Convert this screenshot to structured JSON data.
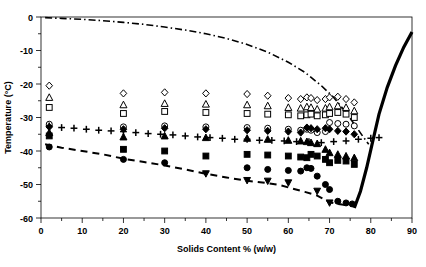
{
  "chart_data": {
    "type": "scatter",
    "title": "",
    "subtitle": "",
    "xlabel": "Solids Content % (w/w)",
    "ylabel": "Temperature (°C)",
    "xlim": [
      0,
      90
    ],
    "ylim": [
      -60,
      0
    ],
    "xticks": [
      0,
      10,
      20,
      30,
      40,
      50,
      60,
      70,
      80,
      90
    ],
    "xtick_labels": [
      "0",
      "10",
      "20",
      "30",
      "40",
      "50",
      "60",
      "70",
      "80",
      "90"
    ],
    "yticks": [
      0,
      -10,
      -20,
      -30,
      -40,
      -50,
      -60
    ],
    "ytick_labels": [
      "0",
      "-10",
      "-20",
      "-30",
      "-40",
      "-50",
      "-60"
    ],
    "x_minor_tick_step": 5,
    "y_minor_tick_step": 5,
    "grid": false,
    "legend": null,
    "legend_position": "none",
    "frame": true,
    "series": [
      {
        "name": "open-diamond",
        "marker": "diamond-open",
        "points": [
          [
            2,
            -20.5
          ],
          [
            20,
            -22.8
          ],
          [
            30,
            -22.5
          ],
          [
            40,
            -22.8
          ],
          [
            50,
            -23.0
          ],
          [
            55,
            -23.5
          ],
          [
            60,
            -24.2
          ],
          [
            63,
            -24.5
          ],
          [
            64.5,
            -24.0
          ],
          [
            65.5,
            -24.2
          ],
          [
            67,
            -24.8
          ],
          [
            69,
            -24.5
          ],
          [
            70,
            -24.0
          ],
          [
            72,
            -23.8
          ],
          [
            74,
            -24.5
          ],
          [
            76,
            -25.5
          ]
        ]
      },
      {
        "name": "open-triangle",
        "marker": "triangle-open",
        "points": [
          [
            2,
            -24.0
          ],
          [
            20,
            -26.2
          ],
          [
            30,
            -25.8
          ],
          [
            40,
            -26.0
          ],
          [
            50,
            -26.2
          ],
          [
            55,
            -26.5
          ],
          [
            60,
            -27.0
          ],
          [
            63,
            -27.2
          ],
          [
            64.5,
            -26.8
          ],
          [
            65.5,
            -27.0
          ],
          [
            67,
            -27.5
          ],
          [
            69,
            -27.2
          ],
          [
            70,
            -26.8
          ],
          [
            72,
            -26.5
          ],
          [
            74,
            -27.0
          ],
          [
            76,
            -28.0
          ]
        ]
      },
      {
        "name": "open-square",
        "marker": "square-open",
        "points": [
          [
            2,
            -27.0
          ],
          [
            20,
            -28.8
          ],
          [
            30,
            -28.2
          ],
          [
            40,
            -28.5
          ],
          [
            50,
            -28.8
          ],
          [
            55,
            -29.0
          ],
          [
            60,
            -29.2
          ],
          [
            63,
            -29.5
          ],
          [
            64.5,
            -29.2
          ],
          [
            65.5,
            -29.0
          ],
          [
            67,
            -29.5
          ],
          [
            69,
            -29.2
          ],
          [
            70,
            -28.8
          ],
          [
            72,
            -28.5
          ],
          [
            74,
            -29.0
          ],
          [
            76,
            -30.0
          ]
        ]
      },
      {
        "name": "open-circle",
        "marker": "circle-open",
        "points": [
          [
            2,
            -32.0
          ],
          [
            20,
            -32.8
          ],
          [
            30,
            -32.5
          ],
          [
            40,
            -32.8
          ],
          [
            50,
            -33.0
          ],
          [
            55,
            -33.2
          ],
          [
            60,
            -33.5
          ],
          [
            63,
            -33.8
          ],
          [
            64.5,
            -33.5
          ],
          [
            65.5,
            -33.8
          ],
          [
            67,
            -34.5
          ],
          [
            69,
            -34.2
          ],
          [
            70,
            -31.5
          ],
          [
            72,
            -31.8
          ],
          [
            74,
            -32.0
          ],
          [
            76,
            -32.5
          ]
        ]
      },
      {
        "name": "plus",
        "marker": "plus",
        "points": [
          [
            2,
            -32.5
          ],
          [
            5,
            -33.0
          ],
          [
            8,
            -33.2
          ],
          [
            11,
            -33.5
          ],
          [
            14,
            -33.8
          ],
          [
            17,
            -34.0
          ],
          [
            20,
            -34.2
          ],
          [
            23,
            -34.5
          ],
          [
            26,
            -34.8
          ],
          [
            29,
            -35.0
          ],
          [
            32,
            -35.2
          ],
          [
            35,
            -35.5
          ],
          [
            38,
            -35.8
          ],
          [
            41,
            -36.0
          ],
          [
            44,
            -36.2
          ],
          [
            47,
            -36.5
          ],
          [
            50,
            -36.5
          ],
          [
            53,
            -36.8
          ],
          [
            56,
            -36.8
          ],
          [
            59,
            -37.0
          ],
          [
            62,
            -37.2
          ],
          [
            65,
            -37.2
          ],
          [
            68,
            -37.5
          ],
          [
            71,
            -37.2
          ],
          [
            74,
            -37.0
          ],
          [
            77,
            -36.5
          ],
          [
            80,
            -36.2
          ],
          [
            82,
            -36.0
          ]
        ]
      },
      {
        "name": "filled-diamond",
        "marker": "diamond-filled",
        "points": [
          [
            2,
            -32.8
          ],
          [
            20,
            -33.5
          ],
          [
            30,
            -33.2
          ],
          [
            40,
            -33.5
          ],
          [
            50,
            -33.8
          ],
          [
            55,
            -34.0
          ],
          [
            60,
            -34.2
          ],
          [
            63,
            -34.5
          ],
          [
            64.5,
            -33.0
          ],
          [
            65.5,
            -33.2
          ],
          [
            67,
            -33.5
          ],
          [
            69,
            -33.2
          ],
          [
            70,
            -33.5
          ],
          [
            72,
            -34.0
          ],
          [
            74,
            -34.2
          ],
          [
            76,
            -35.0
          ]
        ]
      },
      {
        "name": "filled-triangle",
        "marker": "triangle-filled",
        "points": [
          [
            2,
            -34.5
          ],
          [
            20,
            -35.8
          ],
          [
            30,
            -35.5
          ],
          [
            40,
            -36.0
          ],
          [
            50,
            -36.2
          ],
          [
            55,
            -36.5
          ],
          [
            60,
            -36.8
          ],
          [
            63,
            -37.0
          ],
          [
            64.5,
            -37.2
          ],
          [
            65.5,
            -37.5
          ],
          [
            67,
            -37.8
          ],
          [
            69,
            -39.5
          ],
          [
            70,
            -40.5
          ],
          [
            72,
            -41.0
          ],
          [
            74,
            -41.5
          ],
          [
            76,
            -42.0
          ]
        ]
      },
      {
        "name": "filled-square",
        "marker": "square-filled",
        "points": [
          [
            2,
            -35.5
          ],
          [
            20,
            -39.5
          ],
          [
            30,
            -40.0
          ],
          [
            40,
            -41.5
          ],
          [
            50,
            -41.0
          ],
          [
            55,
            -41.2
          ],
          [
            60,
            -41.5
          ],
          [
            63,
            -41.8
          ],
          [
            64.5,
            -42.0
          ],
          [
            65.5,
            -41.0
          ],
          [
            67,
            -41.5
          ],
          [
            69,
            -42.5
          ],
          [
            70,
            -43.5
          ],
          [
            72,
            -42.8
          ],
          [
            74,
            -43.0
          ],
          [
            76,
            -44.0
          ]
        ]
      },
      {
        "name": "filled-circle",
        "marker": "circle-filled",
        "points": [
          [
            2,
            -38.8
          ],
          [
            20,
            -42.5
          ],
          [
            30,
            -43.5
          ],
          [
            50,
            -45.0
          ],
          [
            55,
            -45.5
          ],
          [
            60,
            -45.8
          ],
          [
            63,
            -46.0
          ],
          [
            64.5,
            -45.0
          ],
          [
            65.5,
            -45.2
          ],
          [
            67,
            -47.5
          ],
          [
            69,
            -50.0
          ],
          [
            70,
            -51.5
          ],
          [
            72,
            -55.0
          ],
          [
            74,
            -55.5
          ],
          [
            75.5,
            -55.8
          ]
        ]
      },
      {
        "name": "filled-triangle-down",
        "marker": "triangle-down-filled",
        "points": [
          [
            40,
            -46.8
          ],
          [
            50,
            -48.8
          ],
          [
            55,
            -49.0
          ],
          [
            60,
            -49.5
          ],
          [
            67,
            -52.0
          ],
          [
            70,
            -55.5
          ]
        ]
      }
    ],
    "lines": [
      {
        "name": "freezing-curve",
        "style": "dash-dot",
        "color": "#000000",
        "width": 1.6,
        "points": [
          [
            1,
            -0.2
          ],
          [
            5,
            -0.4
          ],
          [
            10,
            -0.7
          ],
          [
            15,
            -1.1
          ],
          [
            20,
            -1.6
          ],
          [
            25,
            -2.2
          ],
          [
            30,
            -3.0
          ],
          [
            35,
            -3.9
          ],
          [
            40,
            -5.0
          ],
          [
            45,
            -6.4
          ],
          [
            50,
            -8.2
          ],
          [
            55,
            -10.5
          ],
          [
            60,
            -13.5
          ],
          [
            64,
            -16.5
          ],
          [
            68,
            -20.5
          ],
          [
            71,
            -24.0
          ],
          [
            74,
            -28.5
          ],
          [
            76,
            -32.0
          ],
          [
            78,
            -35.5
          ],
          [
            79.5,
            -38.0
          ]
        ]
      },
      {
        "name": "glass-transition-curve",
        "style": "dashed",
        "color": "#000000",
        "width": 2.0,
        "points": [
          [
            1,
            -38.0
          ],
          [
            5,
            -39.0
          ],
          [
            10,
            -40.0
          ],
          [
            15,
            -41.0
          ],
          [
            20,
            -42.3
          ],
          [
            25,
            -43.3
          ],
          [
            30,
            -44.3
          ],
          [
            35,
            -45.5
          ],
          [
            40,
            -46.8
          ],
          [
            45,
            -47.9
          ],
          [
            50,
            -48.9
          ],
          [
            55,
            -49.6
          ],
          [
            58,
            -50.2
          ],
          [
            61,
            -51.2
          ],
          [
            64,
            -52.2
          ],
          [
            67,
            -53.3
          ],
          [
            70,
            -55.3
          ],
          [
            73,
            -56.0
          ],
          [
            75.5,
            -56.3
          ]
        ]
      },
      {
        "name": "solubility-curve",
        "style": "solid",
        "color": "#000000",
        "width": 3.2,
        "points": [
          [
            76.0,
            -57.0
          ],
          [
            77.5,
            -52.0
          ],
          [
            79.0,
            -45.0
          ],
          [
            80.5,
            -37.0
          ],
          [
            82.0,
            -29.0
          ],
          [
            84.0,
            -21.0
          ],
          [
            86.0,
            -14.5
          ],
          [
            88.0,
            -9.0
          ],
          [
            90.0,
            -4.5
          ]
        ]
      }
    ]
  }
}
